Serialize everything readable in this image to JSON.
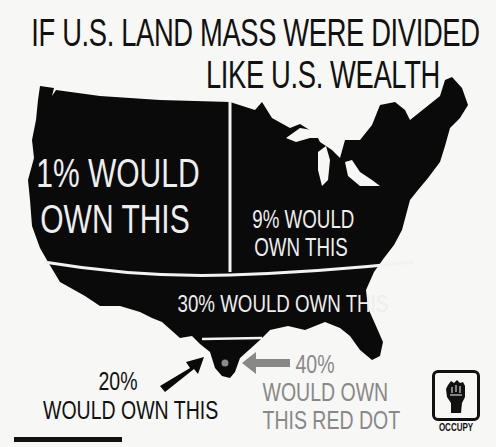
{
  "title": {
    "line1": "IF U.S. LAND MASS WERE DIVIDED",
    "line2": "LIKE U.S. WEALTH"
  },
  "regions": [
    {
      "id": "west",
      "label_line1": "1% WOULD",
      "label_line2": "OWN THIS",
      "share_of_population_label": "1%"
    },
    {
      "id": "northeast",
      "label_line1": "9% WOULD",
      "label_line2": "OWN THIS",
      "share_of_population_label": "9%"
    },
    {
      "id": "south",
      "label": "30% WOULD OWN THIS",
      "share_of_population_label": "30%"
    },
    {
      "id": "texas-tip",
      "label_line1": "20%",
      "label_line2": "WOULD OWN THIS",
      "share_of_population_label": "20%"
    },
    {
      "id": "red-dot",
      "label_line1": "40%",
      "label_line2": "WOULD OWN",
      "label_line3": "THIS RED DOT",
      "share_of_population_label": "40%"
    }
  ],
  "logo": {
    "text": "OCCUPY",
    "icon": "raised-fist-icon"
  },
  "colors": {
    "land": "#0a0a0a",
    "background": "#f7f7f5",
    "divider": "#f2f2f2",
    "gray_text": "#888888",
    "dot": "#8a8a8a"
  }
}
